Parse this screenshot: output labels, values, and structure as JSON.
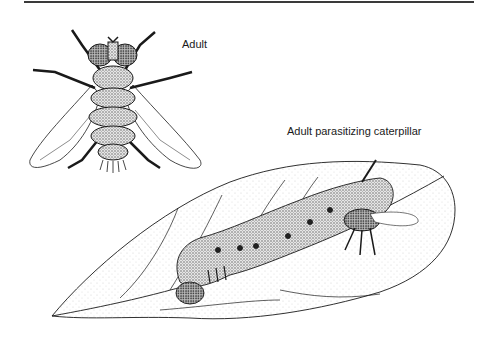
{
  "figure": {
    "labels": {
      "adult": "Adult",
      "parasitizing": "Adult parasitizing caterpillar"
    },
    "panels": [
      {
        "name": "adult-fly",
        "description": "Dorsal view of adult tachinid fly with spread wings"
      },
      {
        "name": "caterpillar-on-leaf",
        "description": "Fly adult on hornworm caterpillar resting on leaf"
      }
    ],
    "colors": {
      "ink": "#1a1a1a",
      "stipple": "#bdbdbd",
      "paper": "#ffffff",
      "rule": "#3a3a3a"
    }
  }
}
